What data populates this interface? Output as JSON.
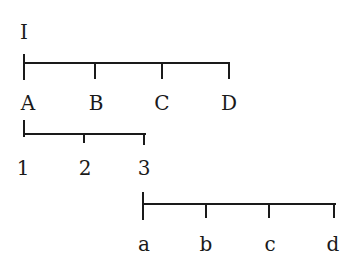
{
  "diagram": {
    "title_label": "I",
    "scales": [
      {
        "name": "upper-case-scale",
        "labels": [
          "A",
          "B",
          "C",
          "D"
        ]
      },
      {
        "name": "number-scale",
        "labels": [
          "1",
          "2",
          "3"
        ]
      },
      {
        "name": "lower-case-scale",
        "labels": [
          "a",
          "b",
          "c",
          "d"
        ]
      }
    ]
  }
}
